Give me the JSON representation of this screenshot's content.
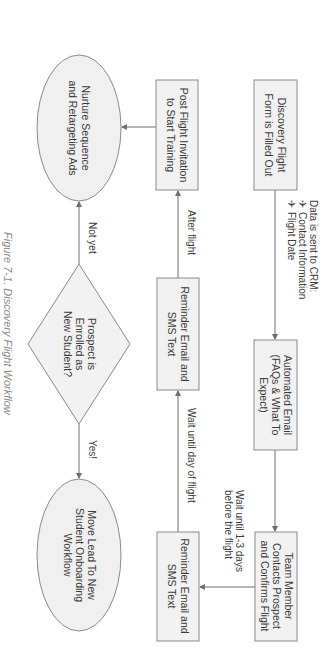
{
  "figure": {
    "caption": "Figure 7-1. Discovery Flight Workflow",
    "orientation": "rotated-90-clockwise"
  },
  "nodes": {
    "discovery_form": {
      "shape": "rectangle",
      "lines": [
        "Discovery Flight",
        "Form is Filled Out"
      ]
    },
    "automated_email": {
      "shape": "rectangle",
      "lines": [
        "Automated Email",
        "(FAQs & What To",
        "Expect)"
      ]
    },
    "team_member": {
      "shape": "rectangle",
      "lines": [
        "Team Member",
        "Contacts Prospect",
        "and Confirms Flight"
      ]
    },
    "reminder_2": {
      "shape": "rectangle",
      "lines": [
        "Reminder Email and",
        "SMS Text"
      ]
    },
    "reminder_1": {
      "shape": "rectangle",
      "lines": [
        "Reminder Email and",
        "SMS Text"
      ]
    },
    "post_flight": {
      "shape": "rectangle",
      "lines": [
        "Post Flight Invitation",
        "to Start Training"
      ]
    },
    "decision": {
      "shape": "diamond",
      "lines": [
        "Prospect is",
        "Enrolled as",
        "New Student?"
      ]
    },
    "nurture": {
      "shape": "ellipse",
      "lines": [
        "Nurture Sequence",
        "and Retargeting Ads"
      ]
    },
    "onboarding": {
      "shape": "ellipse",
      "lines": [
        "Move Lead To New",
        "Student Onboarding",
        "Workflow"
      ]
    }
  },
  "edges": {
    "crm_note": {
      "title": "Data is sent to CRM:",
      "bullet_glyph": "✈",
      "items": [
        "Contact Information",
        "Flight Date"
      ]
    },
    "wait_1_3_days": [
      "Wait until 1-3 days",
      "before the flight"
    ],
    "wait_day_of_flight": "Wait until day of flight",
    "after_flight": "After flight",
    "not_yet": "Not yet",
    "yes": "Yes!"
  },
  "colors": {
    "box_fill": "#f2f2f2",
    "box_stroke": "#8a8a8a",
    "text": "#3a3a3a",
    "caption": "#8a8a8a"
  }
}
